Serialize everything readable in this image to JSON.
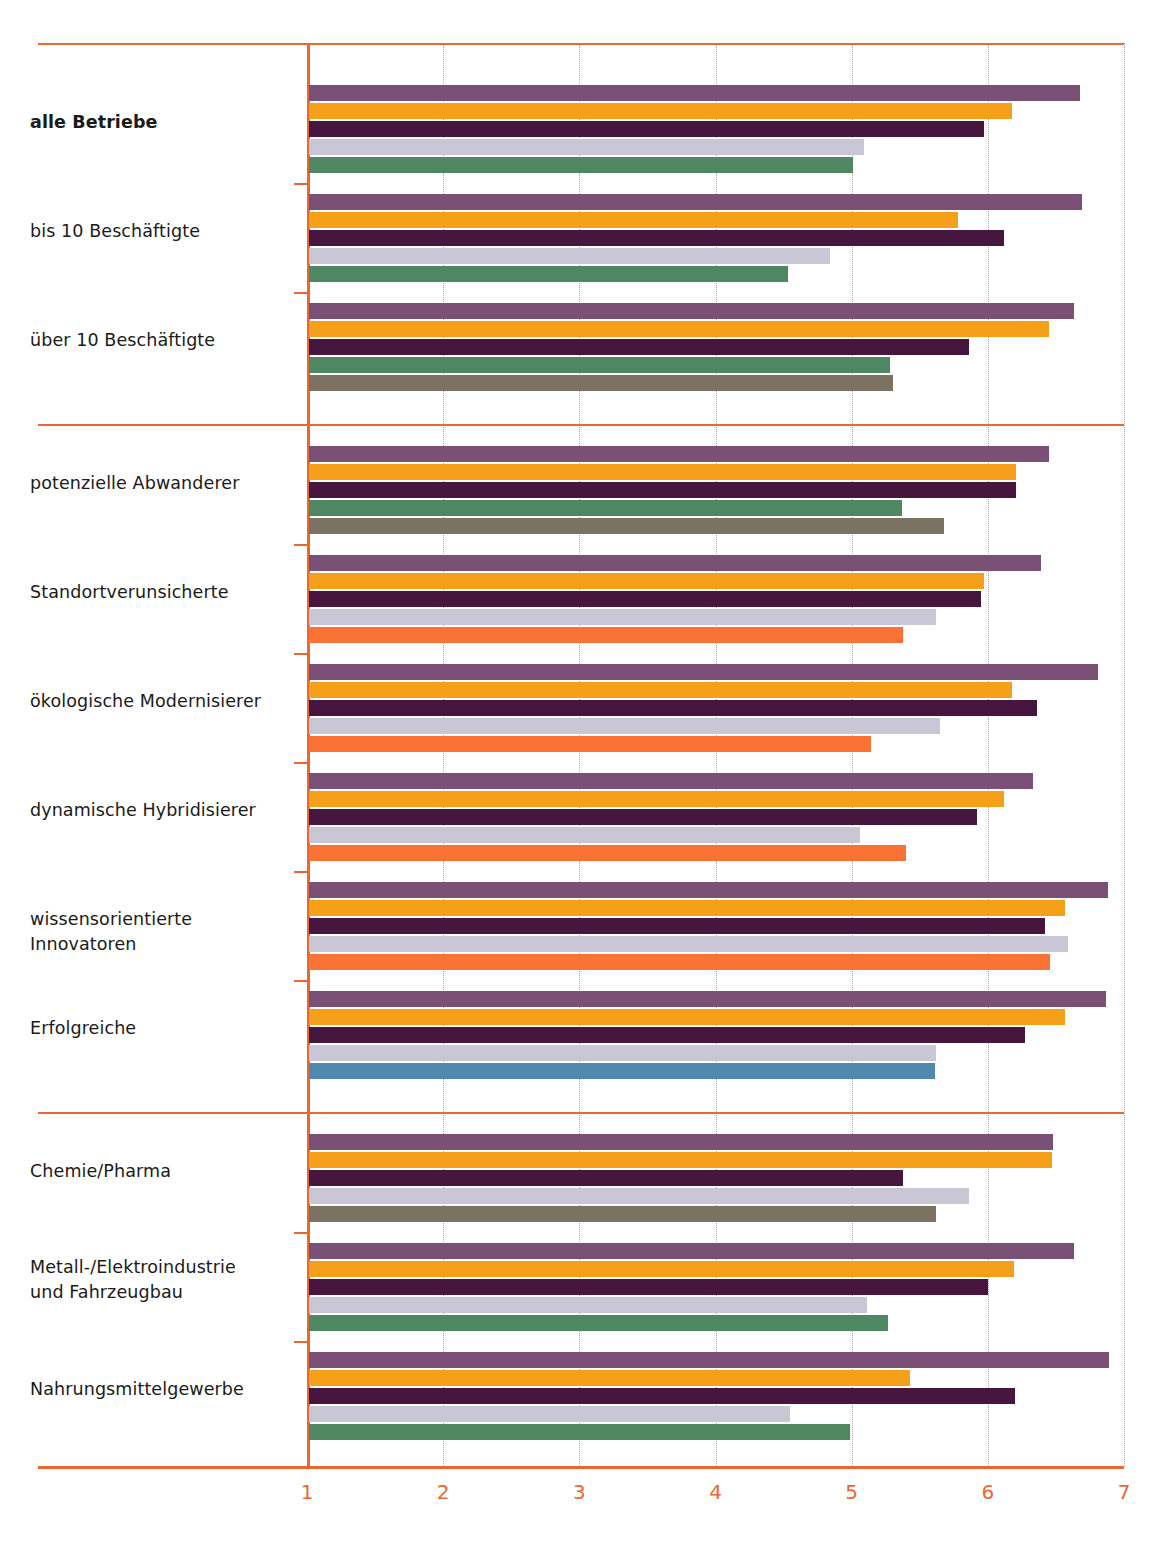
{
  "chart_data": {
    "type": "bar",
    "orientation": "horizontal",
    "title": "",
    "subtitle": "",
    "xlabel": "",
    "ylabel": "",
    "xlim": [
      1,
      7
    ],
    "xticks": [
      "1",
      "2",
      "3",
      "4",
      "5",
      "6",
      "7"
    ],
    "grid": "vertical dotted gridlines at each integer tick",
    "legend": "none shown",
    "axis_color": "#ec6730",
    "series_colors": {
      "purple": "#7a5076",
      "orange": "#f6a01a",
      "dark-purple": "#47163f",
      "light-lavender": "#c9c6d6",
      "green": "#4f8762",
      "brown": "#7c7262",
      "orange-red": "#fb7334",
      "blue": "#5089ae"
    },
    "sections": [
      {
        "name": "Betriebsgroesse",
        "groups": [
          {
            "label": "alle Betriebe",
            "bold": true,
            "bars": [
              {
                "color": "purple",
                "value": 6.68
              },
              {
                "color": "orange",
                "value": 6.18
              },
              {
                "color": "dark-purple",
                "value": 5.97
              },
              {
                "color": "light-lavender",
                "value": 5.09
              },
              {
                "color": "green",
                "value": 5.01
              }
            ]
          },
          {
            "label": "bis 10 Beschäftigte",
            "bold": false,
            "bars": [
              {
                "color": "purple",
                "value": 6.69
              },
              {
                "color": "orange",
                "value": 5.78
              },
              {
                "color": "dark-purple",
                "value": 6.12
              },
              {
                "color": "light-lavender",
                "value": 4.84
              },
              {
                "color": "green",
                "value": 4.53
              }
            ]
          },
          {
            "label": "über 10 Beschäftigte",
            "bold": false,
            "bars": [
              {
                "color": "purple",
                "value": 6.63
              },
              {
                "color": "orange",
                "value": 6.45
              },
              {
                "color": "dark-purple",
                "value": 5.86
              },
              {
                "color": "green",
                "value": 5.28
              },
              {
                "color": "brown",
                "value": 5.3
              }
            ]
          }
        ]
      },
      {
        "name": "Betriebstypen",
        "groups": [
          {
            "label": "potenzielle Abwanderer",
            "bold": false,
            "bars": [
              {
                "color": "purple",
                "value": 6.45
              },
              {
                "color": "orange",
                "value": 6.21
              },
              {
                "color": "dark-purple",
                "value": 6.21
              },
              {
                "color": "green",
                "value": 5.37
              },
              {
                "color": "brown",
                "value": 5.68
              }
            ]
          },
          {
            "label": "Standortverunsicherte",
            "bold": false,
            "bars": [
              {
                "color": "purple",
                "value": 6.39
              },
              {
                "color": "orange",
                "value": 5.97
              },
              {
                "color": "dark-purple",
                "value": 5.95
              },
              {
                "color": "light-lavender",
                "value": 5.62
              },
              {
                "color": "orange-red",
                "value": 5.38
              }
            ]
          },
          {
            "label": "ökologische Modernisierer",
            "bold": false,
            "bars": [
              {
                "color": "purple",
                "value": 6.81
              },
              {
                "color": "orange",
                "value": 6.18
              },
              {
                "color": "dark-purple",
                "value": 6.36
              },
              {
                "color": "light-lavender",
                "value": 5.65
              },
              {
                "color": "orange-red",
                "value": 5.14
              }
            ]
          },
          {
            "label": "dynamische Hybridisierer",
            "bold": false,
            "bars": [
              {
                "color": "purple",
                "value": 6.33
              },
              {
                "color": "orange",
                "value": 6.12
              },
              {
                "color": "dark-purple",
                "value": 5.92
              },
              {
                "color": "light-lavender",
                "value": 5.06
              },
              {
                "color": "orange-red",
                "value": 5.4
              }
            ]
          },
          {
            "label": "wissensorientierte Innovatoren",
            "bold": false,
            "bars": [
              {
                "color": "purple",
                "value": 6.88
              },
              {
                "color": "orange",
                "value": 6.57
              },
              {
                "color": "dark-purple",
                "value": 6.42
              },
              {
                "color": "light-lavender",
                "value": 6.59
              },
              {
                "color": "orange-red",
                "value": 6.46
              }
            ]
          },
          {
            "label": "Erfolgreiche",
            "bold": false,
            "bars": [
              {
                "color": "purple",
                "value": 6.87
              },
              {
                "color": "orange",
                "value": 6.57
              },
              {
                "color": "dark-purple",
                "value": 6.27
              },
              {
                "color": "light-lavender",
                "value": 5.62
              },
              {
                "color": "blue",
                "value": 5.61
              }
            ]
          }
        ]
      },
      {
        "name": "Branchen",
        "groups": [
          {
            "label": "Chemie/Pharma",
            "bold": false,
            "bars": [
              {
                "color": "purple",
                "value": 6.48
              },
              {
                "color": "orange",
                "value": 6.47
              },
              {
                "color": "dark-purple",
                "value": 5.38
              },
              {
                "color": "light-lavender",
                "value": 5.86
              },
              {
                "color": "brown",
                "value": 5.62
              }
            ]
          },
          {
            "label": "Metall-/Elektroindustrie\nund Fahrzeugbau",
            "bold": false,
            "bars": [
              {
                "color": "purple",
                "value": 6.63
              },
              {
                "color": "orange",
                "value": 6.19
              },
              {
                "color": "dark-purple",
                "value": 6.0
              },
              {
                "color": "light-lavender",
                "value": 5.11
              },
              {
                "color": "green",
                "value": 5.27
              }
            ]
          },
          {
            "label": "Nahrungsmittelgewerbe",
            "bold": false,
            "bars": [
              {
                "color": "purple",
                "value": 6.89
              },
              {
                "color": "orange",
                "value": 5.43
              },
              {
                "color": "dark-purple",
                "value": 6.2
              },
              {
                "color": "light-lavender",
                "value": 4.55
              },
              {
                "color": "green",
                "value": 4.99
              }
            ]
          }
        ]
      }
    ]
  }
}
